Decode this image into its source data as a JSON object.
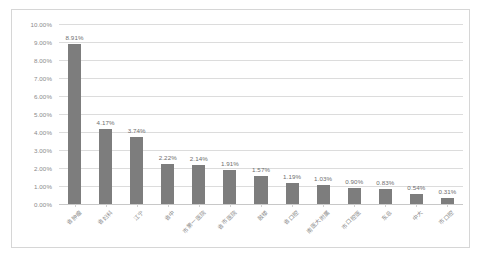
{
  "chart_data": {
    "type": "bar",
    "title": "",
    "xlabel": "",
    "ylabel": "",
    "ylim": [
      0,
      10
    ],
    "ytick_format": "percent",
    "grid": true,
    "legend": false,
    "bar_color": "#7d7d7d",
    "categories": [
      "省肿瘤",
      "省妇科",
      "江宁",
      "省中",
      "市第一医院",
      "省市医院",
      "鼓楼",
      "省口腔",
      "南医大附属",
      "市口腔医",
      "东总",
      "中大",
      "市口腔"
    ],
    "values": [
      8.91,
      4.17,
      3.74,
      2.22,
      2.14,
      1.91,
      1.57,
      1.19,
      1.03,
      0.9,
      0.83,
      0.54,
      0.31
    ],
    "value_labels": [
      "8.91%",
      "4.17%",
      "3.74%",
      "2.22%",
      "2.14%",
      "1.91%",
      "1.57%",
      "1.19%",
      "1.03%",
      "0.90%",
      "0.83%",
      "0.54%",
      "0.31%"
    ],
    "ytick_labels": [
      "10.00%",
      "9.00%",
      "8.00%",
      "7.00%",
      "6.00%",
      "5.00%",
      "4.00%",
      "3.00%",
      "2.00%",
      "1.00%",
      "0.00%"
    ],
    "ytick_values": [
      10,
      9,
      8,
      7,
      6,
      5,
      4,
      3,
      2,
      1,
      0
    ]
  }
}
